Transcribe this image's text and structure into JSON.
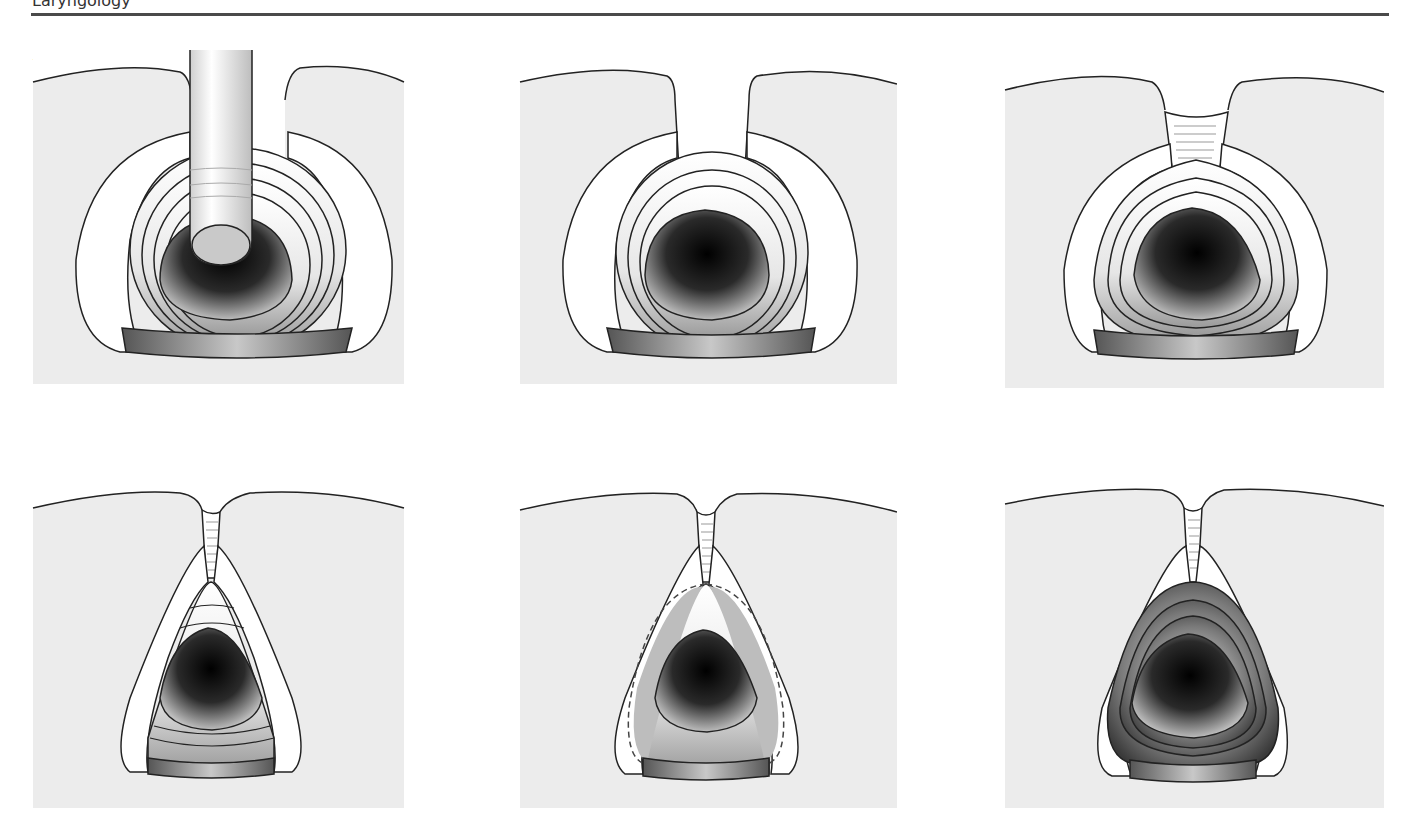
{
  "header": {
    "section_title": "Laryngology"
  },
  "colors": {
    "rule": "#4a4a4a",
    "tissue_bg": "#ececec",
    "outline": "#222222",
    "lumen_dark": "#000000",
    "cartilage": "#ffffff",
    "excision_zone": "#bdbdbd"
  },
  "panels": [
    {
      "label": "A",
      "depiction": "airway-with-tube"
    },
    {
      "label": "B",
      "depiction": "open-posterior-gap"
    },
    {
      "label": "C",
      "depiction": "early-scar-band"
    },
    {
      "label": "D",
      "depiction": "narrowed-triangular-airway"
    },
    {
      "label": "E",
      "depiction": "dashed-excision-outline"
    },
    {
      "label": "F",
      "depiction": "reconstructed-airway"
    }
  ]
}
